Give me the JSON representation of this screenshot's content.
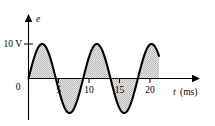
{
  "figure": {
    "background_color": "#ffffff",
    "ink_color": "#000000",
    "fill_color": "#d5d5d5",
    "fill_style": "stippled-checker"
  },
  "chart_data": {
    "type": "line",
    "title": "",
    "subtitle": "",
    "xlabel": "t",
    "xunit": "(ms)",
    "xlabel_full": "t (ms)",
    "ylabel": "e",
    "yunit": "V",
    "origin_label": "0",
    "y_tick_labels": [
      "10 V"
    ],
    "y_tick_values": [
      10
    ],
    "x_tick_labels": [
      "5",
      "10",
      "15",
      "20"
    ],
    "x_tick_values": [
      5,
      10,
      15,
      20
    ],
    "xlim": [
      0,
      23
    ],
    "ylim": [
      -13,
      13
    ],
    "grid": false,
    "legend": false,
    "annotations": [],
    "series": [
      {
        "name": "e(t)",
        "kind": "sine",
        "amplitude": 10,
        "period_ms": 9,
        "phase_deg": 0,
        "offset": 0,
        "t_start": 0,
        "t_end": 21.5,
        "fill_to_zero": true,
        "equation": "e = 10 sin(2*pi*t/9) V",
        "x": [
          0,
          0.5,
          1,
          1.5,
          2,
          2.25,
          2.5,
          3,
          3.5,
          4,
          4.5,
          5,
          5.5,
          6,
          6.5,
          6.75,
          7,
          7.5,
          8,
          8.5,
          9,
          9.5,
          10,
          10.5,
          11,
          11.25,
          11.5,
          12,
          12.5,
          13,
          13.5,
          14,
          14.5,
          15,
          15.5,
          15.75,
          16,
          16.5,
          17,
          17.5,
          18,
          18.5,
          19,
          19.5,
          20,
          20.25,
          20.5,
          21,
          21.5
        ],
        "y": [
          0,
          3.42,
          6.43,
          8.66,
          9.85,
          10,
          9.85,
          8.66,
          6.43,
          3.42,
          0,
          -3.42,
          -6.43,
          -8.66,
          -9.85,
          -10,
          -9.85,
          -8.66,
          -6.43,
          -3.42,
          0,
          3.42,
          6.43,
          8.66,
          9.85,
          10,
          9.85,
          8.66,
          6.43,
          3.42,
          0,
          -3.42,
          -6.43,
          -8.66,
          -9.85,
          -10,
          -9.85,
          -8.66,
          -6.43,
          -3.42,
          0,
          3.42,
          6.43,
          8.66,
          9.85,
          10,
          9.85,
          8.66,
          6.43
        ],
        "peaks_ms": [
          2.25,
          11.25,
          20.25
        ],
        "troughs_ms": [
          6.75,
          15.75
        ],
        "zero_crossings_ms": [
          0,
          4.5,
          9,
          13.5,
          18
        ]
      }
    ]
  }
}
